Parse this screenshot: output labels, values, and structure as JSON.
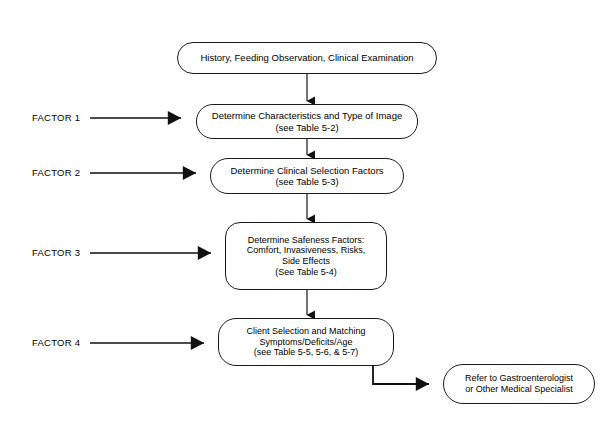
{
  "diagram": {
    "background_color": "#ffffff",
    "line_color": "#1a1a1a",
    "text_color": "#000000",
    "nodes": [
      {
        "id": "start",
        "name": "history-feeding-observation-node",
        "text": "History, Feeding Observation, Clinical Examination",
        "shape": "stadium",
        "x": 177,
        "y": 42,
        "w": 260,
        "h": 32,
        "font_size": 9.5,
        "radius": 16
      },
      {
        "id": "factor1-node",
        "name": "determine-characteristics-node",
        "text": "Determine Characteristics and Type of Image\n(see Table 5-2)",
        "shape": "stadium",
        "x": 196,
        "y": 104,
        "w": 222,
        "h": 35,
        "font_size": 9.5,
        "radius": 17
      },
      {
        "id": "factor2-node",
        "name": "determine-clinical-selection-factors-node",
        "text": "Determine Clinical Selection Factors\n(see Table 5-3)",
        "shape": "stadium",
        "x": 210,
        "y": 158,
        "w": 194,
        "h": 36,
        "font_size": 9.5,
        "radius": 18
      },
      {
        "id": "factor3-node",
        "name": "determine-safeness-factors-node",
        "text": "Determine Safeness Factors:\nComfort, Invasiveness, Risks,\nSide Effects\n(See Table 5-4)",
        "shape": "rounded-rect",
        "x": 225,
        "y": 222,
        "w": 162,
        "h": 68,
        "font_size": 9,
        "radius": 15
      },
      {
        "id": "factor4-node",
        "name": "client-selection-matching-node",
        "text": "Client Selection and Matching\nSymptoms/Deficits/Age\n(see Table 5-5, 5-6, & 5-7)",
        "shape": "rounded-rect",
        "x": 218,
        "y": 318,
        "w": 176,
        "h": 48,
        "font_size": 9,
        "radius": 18
      },
      {
        "id": "referral-node",
        "name": "refer-to-gastroenterologist-node",
        "text": "Refer to Gastroenterologist\nor Other Medical Specialist",
        "shape": "stadium",
        "x": 443,
        "y": 364,
        "w": 152,
        "h": 40,
        "font_size": 9,
        "radius": 20
      }
    ],
    "factor_labels": [
      {
        "name": "factor-1-label",
        "text": "FACTOR 1",
        "x": 32,
        "y": 112
      },
      {
        "name": "factor-2-label",
        "text": "FACTOR 2",
        "x": 32,
        "y": 167
      },
      {
        "name": "factor-3-label",
        "text": "FACTOR 3",
        "x": 32,
        "y": 247
      },
      {
        "name": "factor-4-label",
        "text": "FACTOR 4",
        "x": 32,
        "y": 337
      }
    ],
    "connectors": [
      {
        "name": "connector-start-to-factor1",
        "type": "vertical-arrow",
        "x": 307,
        "y1": 74,
        "y2": 104
      },
      {
        "name": "connector-factor1-to-factor2",
        "type": "vertical-arrow",
        "x": 307,
        "y1": 139,
        "y2": 158
      },
      {
        "name": "connector-factor2-to-factor3",
        "type": "vertical-arrow",
        "x": 307,
        "y1": 194,
        "y2": 222
      },
      {
        "name": "connector-factor3-to-factor4",
        "type": "vertical-arrow",
        "x": 307,
        "y1": 290,
        "y2": 318
      },
      {
        "name": "connector-factor1-input-arrow",
        "type": "horizontal-arrow",
        "x1": 90,
        "x2": 196,
        "y": 118
      },
      {
        "name": "connector-factor2-input-arrow",
        "type": "horizontal-arrow",
        "x1": 90,
        "x2": 210,
        "y": 173
      },
      {
        "name": "connector-factor3-input-arrow",
        "type": "horizontal-arrow",
        "x1": 90,
        "x2": 225,
        "y": 253
      },
      {
        "name": "connector-factor4-input-arrow",
        "type": "horizontal-arrow",
        "x1": 90,
        "x2": 218,
        "y": 343
      },
      {
        "name": "connector-factor4-to-referral",
        "type": "elbow-arrow",
        "x1": 373,
        "y1": 366,
        "y2": 384,
        "x2": 443
      }
    ]
  }
}
